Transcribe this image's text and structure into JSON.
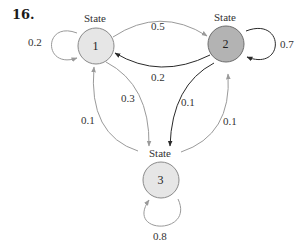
{
  "problem_number": "16.",
  "colors": {
    "state_light_fill": "#e6e6e6",
    "state_dark_fill": "#b3b3b3",
    "state_stroke": "#8a8a8a",
    "arrow_light": "#9a9a9a",
    "arrow_dark": "#2a2a2a"
  },
  "states": [
    {
      "id": "1",
      "title": "State",
      "label": "1",
      "fill": "light"
    },
    {
      "id": "2",
      "title": "State",
      "label": "2",
      "fill": "dark"
    },
    {
      "id": "3",
      "title": "State",
      "label": "3",
      "fill": "light"
    }
  ],
  "transitions": [
    {
      "from": "1",
      "to": "1",
      "probability": "0.2",
      "style": "light"
    },
    {
      "from": "1",
      "to": "2",
      "probability": "0.5",
      "style": "light"
    },
    {
      "from": "1",
      "to": "3",
      "probability": "0.3",
      "style": "light"
    },
    {
      "from": "2",
      "to": "1",
      "probability": "0.2",
      "style": "dark"
    },
    {
      "from": "2",
      "to": "2",
      "probability": "0.7",
      "style": "dark"
    },
    {
      "from": "2",
      "to": "3",
      "probability": "0.1",
      "style": "dark"
    },
    {
      "from": "3",
      "to": "1",
      "probability": "0.1",
      "style": "light"
    },
    {
      "from": "3",
      "to": "2",
      "probability": "0.1",
      "style": "light"
    },
    {
      "from": "3",
      "to": "3",
      "probability": "0.8",
      "style": "light"
    }
  ]
}
